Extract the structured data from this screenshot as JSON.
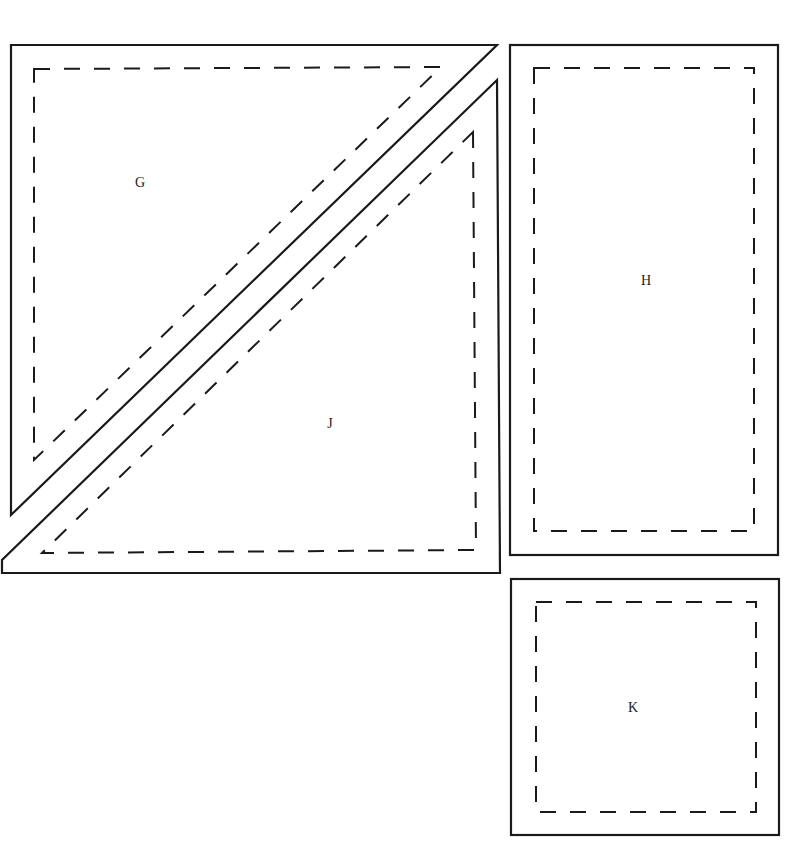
{
  "pieces": [
    {
      "id": "G",
      "label": "G",
      "label_pos": [
        140,
        187
      ],
      "cut_points": "11,45 497,45 11,515",
      "sew_points": "34,69 441,67 34,460"
    },
    {
      "id": "J",
      "label": "J",
      "label_pos": [
        330,
        428
      ],
      "cut_points": "497,80 500,573 2,573 2,560",
      "sew_points": "473,132 476,550 42,553"
    },
    {
      "id": "H",
      "label": "H",
      "label_pos": [
        646,
        285
      ],
      "cut_rect": [
        510,
        45,
        268,
        510
      ],
      "sew_rect": [
        534,
        68,
        220,
        463
      ]
    },
    {
      "id": "K",
      "label": "K",
      "label_pos": [
        633,
        712
      ],
      "cut_rect": [
        511,
        579,
        268,
        256
      ],
      "sew_rect": [
        536,
        602,
        220,
        210
      ]
    }
  ],
  "colors": {
    "line": "#1a1a1a",
    "background": "#ffffff"
  }
}
